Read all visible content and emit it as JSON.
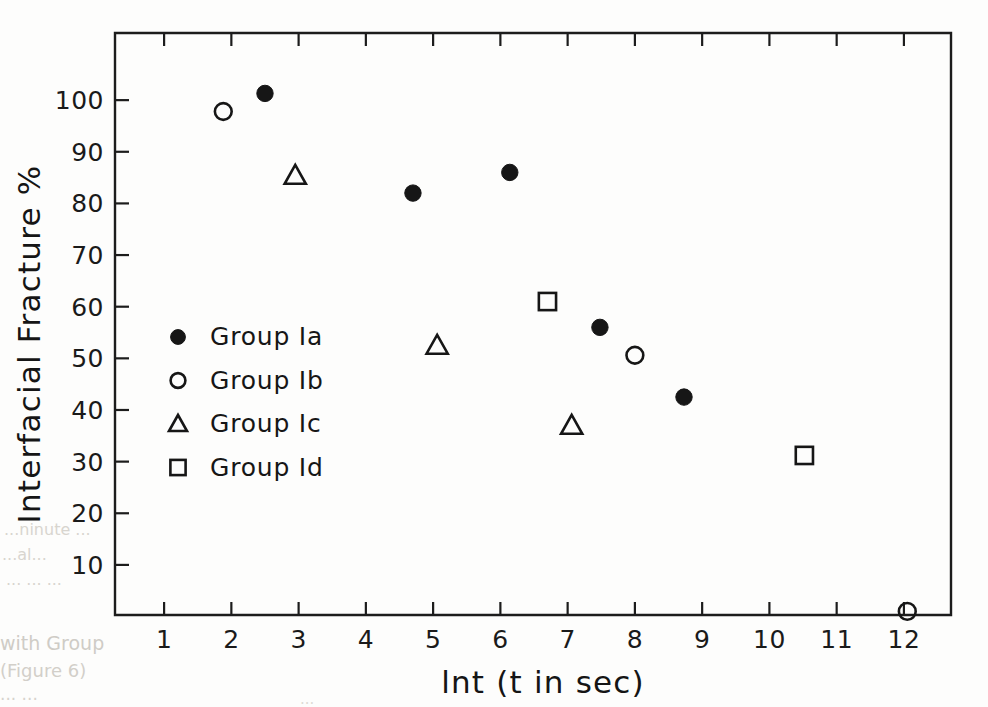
{
  "figure": {
    "background_color": "#fdfdfc",
    "ink_color": "#161616"
  },
  "chart_data": {
    "type": "scatter",
    "title": "",
    "xlabel": "lnt (t in sec)",
    "ylabel": "Interfacial Fracture %",
    "xlim": [
      0.27,
      12.7
    ],
    "ylim": [
      0.3,
      113.0
    ],
    "xticks": [
      "1",
      "2",
      "3",
      "4",
      "5",
      "6",
      "7",
      "8",
      "9",
      "10",
      "11",
      "12"
    ],
    "xtick_values": [
      1,
      2,
      3,
      4,
      5,
      6,
      7,
      8,
      9,
      10,
      11,
      12
    ],
    "yticks": [
      "10",
      "20",
      "30",
      "40",
      "50",
      "60",
      "70",
      "80",
      "90",
      "100"
    ],
    "ytick_values": [
      10,
      20,
      30,
      40,
      50,
      60,
      70,
      80,
      90,
      100
    ],
    "grid": false,
    "legend_position": "center-left",
    "series": [
      {
        "name": "Group Ia",
        "marker": "filled-circle",
        "points": [
          {
            "x": 2.5,
            "y": 101.3
          },
          {
            "x": 4.7,
            "y": 82.0
          },
          {
            "x": 6.14,
            "y": 86.0
          },
          {
            "x": 7.48,
            "y": 56.0
          },
          {
            "x": 8.73,
            "y": 42.5
          }
        ]
      },
      {
        "name": "Group Ib",
        "marker": "open-circle",
        "points": [
          {
            "x": 1.88,
            "y": 97.8
          },
          {
            "x": 8.0,
            "y": 50.6
          },
          {
            "x": 12.05,
            "y": 1.0
          }
        ]
      },
      {
        "name": "Group Ic",
        "marker": "open-triangle",
        "points": [
          {
            "x": 2.95,
            "y": 85.4
          },
          {
            "x": 5.06,
            "y": 52.5
          },
          {
            "x": 7.06,
            "y": 37.0
          }
        ]
      },
      {
        "name": "Group Id",
        "marker": "open-square",
        "points": [
          {
            "x": 6.7,
            "y": 61.0
          },
          {
            "x": 10.52,
            "y": 31.2
          }
        ]
      }
    ]
  },
  "legend": {
    "entries": [
      {
        "marker": "filled-circle",
        "label": "Group Ia"
      },
      {
        "marker": "open-circle",
        "label": "Group Ib"
      },
      {
        "marker": "open-triangle",
        "label": "Group Ic"
      },
      {
        "marker": "open-square",
        "label": "Group Id"
      }
    ]
  },
  "bleed_through": {
    "line1": "...ninute ...",
    "line2": "...al...",
    "line3": "... ... ...",
    "line4": "with Group",
    "line5": "(Figure 6)",
    "line6": "... ...",
    "line7": "..."
  }
}
